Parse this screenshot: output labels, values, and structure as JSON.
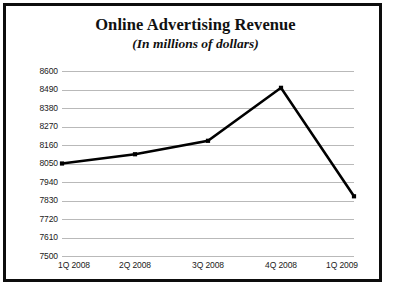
{
  "chart": {
    "title": "Online Advertising Revenue",
    "subtitle": "(In millions of dollars)"
  },
  "chart_data": {
    "type": "line",
    "title": "Online Advertising Revenue",
    "subtitle": "(In millions of dollars)",
    "xlabel": "",
    "ylabel": "",
    "units": "millions of dollars",
    "categories": [
      "1Q 2008",
      "2Q 2008",
      "3Q 2008",
      "4Q 2008",
      "1Q 2009"
    ],
    "series": [
      {
        "name": "Online Advertising Revenue",
        "values": [
          8050,
          8105,
          8185,
          8500,
          7855
        ],
        "color": "#000000",
        "marker": "square",
        "line_width": 2.6
      }
    ],
    "ylim": [
      7500,
      8600
    ],
    "ytick_step": 110,
    "yticks": [
      8600,
      8490,
      8380,
      8270,
      8160,
      8050,
      7940,
      7830,
      7720,
      7610,
      7500
    ],
    "ytick_labels": [
      "8600",
      "8490",
      "8380",
      "8270",
      "8160",
      "8050",
      "7940",
      "7830",
      "7720",
      "7610",
      "7500"
    ],
    "grid": true,
    "grid_axis": "y",
    "grid_color": "#b9b9b9",
    "legend": false,
    "legend_position": "none",
    "axis_line": false,
    "background": "#ffffff",
    "border_color": "#0d0d0d"
  }
}
